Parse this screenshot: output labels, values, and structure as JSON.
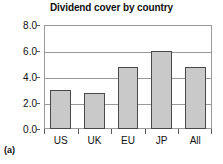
{
  "panel": {
    "label": "(a)"
  },
  "chart_data": {
    "type": "bar",
    "title": "Dividend cover by country",
    "subtitle": "",
    "xlabel": "",
    "ylabel": "",
    "categories": [
      "US",
      "UK",
      "EU",
      "JP",
      "All"
    ],
    "values": [
      3.0,
      2.75,
      4.8,
      6.0,
      4.8
    ],
    "ylim": [
      0.0,
      8.0
    ],
    "ytick_labels": [
      "0.0",
      "2.0",
      "4.0",
      "6.0",
      "8.0"
    ],
    "yticks": [
      0.0,
      2.0,
      4.0,
      6.0,
      8.0
    ],
    "grid": true,
    "legend": "none",
    "bar_fill_color": "#c9c9c9",
    "bar_edge_color": "#4a4a4a",
    "axis_color": "#9a9a9a",
    "text_color": "#111111"
  }
}
